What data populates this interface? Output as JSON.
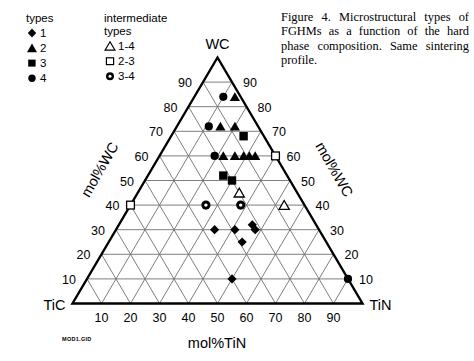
{
  "legend": {
    "primary": {
      "heading": "types",
      "items": [
        {
          "symbol": "filled-diamond",
          "label": "1"
        },
        {
          "symbol": "filled-triangle",
          "label": "2"
        },
        {
          "symbol": "filled-square",
          "label": "3"
        },
        {
          "symbol": "filled-circle",
          "label": "4"
        }
      ]
    },
    "intermediate": {
      "heading_line1": "intermediate",
      "heading_line2": "types",
      "items": [
        {
          "symbol": "open-triangle",
          "label": "1-4"
        },
        {
          "symbol": "open-square",
          "label": "2-3"
        },
        {
          "symbol": "ring-circle",
          "label": "3-4"
        }
      ]
    }
  },
  "caption": {
    "text": "Figure 4. Microstructural types of FGHMs as a function of the hard phase composition. Same sintering profile."
  },
  "file_tag": "MOD1.GID",
  "chart_data": {
    "type": "scatter",
    "subtype": "ternary",
    "title": "",
    "vertices": {
      "top": "WC",
      "bottom_left": "TiC",
      "bottom_right": "TiN"
    },
    "axes": [
      {
        "name": "left",
        "label": "mol%WC",
        "ticks": [
          10,
          20,
          30,
          40,
          50,
          60,
          70,
          80,
          90
        ]
      },
      {
        "name": "right",
        "label": "mol%WC",
        "ticks": [
          10,
          20,
          30,
          40,
          50,
          60,
          70,
          80,
          90
        ]
      },
      {
        "name": "bottom",
        "label": "mol%TiN",
        "ticks": [
          10,
          20,
          30,
          40,
          50,
          60,
          70,
          80,
          90
        ]
      }
    ],
    "grid": true,
    "grid_step": 10,
    "legend_position": "top-left",
    "series": [
      {
        "name": "1",
        "symbol": "filled-diamond",
        "points": [
          {
            "tin": 34,
            "wc": 30
          },
          {
            "tin": 41,
            "wc": 30
          },
          {
            "tin": 46,
            "wc": 32
          },
          {
            "tin": 48,
            "wc": 30
          },
          {
            "tin": 46,
            "wc": 25
          },
          {
            "tin": 50,
            "wc": 10
          }
        ]
      },
      {
        "name": "2",
        "symbol": "filled-triangle",
        "points": [
          {
            "tin": 22,
            "wc": 60
          },
          {
            "tin": 26,
            "wc": 60
          },
          {
            "tin": 29,
            "wc": 60
          },
          {
            "tin": 31,
            "wc": 60
          },
          {
            "tin": 33,
            "wc": 60
          },
          {
            "tin": 15,
            "wc": 72
          },
          {
            "tin": 20,
            "wc": 72
          },
          {
            "tin": 14,
            "wc": 84
          }
        ]
      },
      {
        "name": "3",
        "symbol": "filled-square",
        "points": [
          {
            "tin": 25,
            "wc": 68
          },
          {
            "tin": 26,
            "wc": 52
          },
          {
            "tin": 30,
            "wc": 50
          }
        ]
      },
      {
        "name": "4",
        "symbol": "filled-circle",
        "points": [
          {
            "tin": 10,
            "wc": 84
          },
          {
            "tin": 11,
            "wc": 72
          },
          {
            "tin": 19,
            "wc": 60
          },
          {
            "tin": 90,
            "wc": 10
          }
        ]
      },
      {
        "name": "1-4",
        "symbol": "open-triangle",
        "points": [
          {
            "tin": 35,
            "wc": 45
          },
          {
            "tin": 53,
            "wc": 40
          }
        ]
      },
      {
        "name": "2-3",
        "symbol": "open-square",
        "points": [
          {
            "tin": 40,
            "wc": 60
          },
          {
            "tin": 0,
            "wc": 40
          }
        ]
      },
      {
        "name": "3-4",
        "symbol": "ring-circle",
        "points": [
          {
            "tin": 26,
            "wc": 40
          },
          {
            "tin": 38,
            "wc": 40
          }
        ]
      }
    ]
  },
  "colors": {
    "ink": "#000000",
    "grid": "#6f6f6f",
    "background": "#ffffff"
  }
}
